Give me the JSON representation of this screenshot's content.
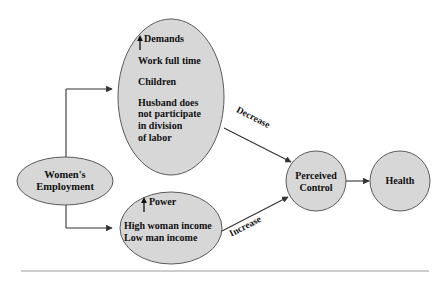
{
  "diagram": {
    "colors": {
      "node_fill": "#d7d7d7",
      "node_stroke": "#5a5a5a",
      "line": "#333333",
      "rule": "#9a9a9a",
      "text": "#101010",
      "background": "#ffffff"
    },
    "nodes": {
      "employment": {
        "name": "womens-employment",
        "shape": "ellipse",
        "lines": [
          "Women's",
          "Employment"
        ]
      },
      "demands": {
        "name": "demands",
        "shape": "ellipse",
        "heading_arrow": "↑",
        "heading": "Demands",
        "lines": [
          "Work full time",
          "Children",
          "Husband does",
          "not participate",
          "in division",
          "of labor"
        ]
      },
      "power": {
        "name": "power",
        "shape": "ellipse",
        "heading_arrow": "↑",
        "heading": "Power",
        "lines": [
          "High woman income",
          "Low man income"
        ]
      },
      "perceived_control": {
        "name": "perceived-control",
        "shape": "circle",
        "lines": [
          "Perceived",
          "Control"
        ]
      },
      "health": {
        "name": "health",
        "shape": "circle",
        "lines": [
          "Health"
        ]
      }
    },
    "edges": {
      "demands_to_control": {
        "label": "Decrease"
      },
      "power_to_control": {
        "label": "Increase"
      }
    }
  }
}
